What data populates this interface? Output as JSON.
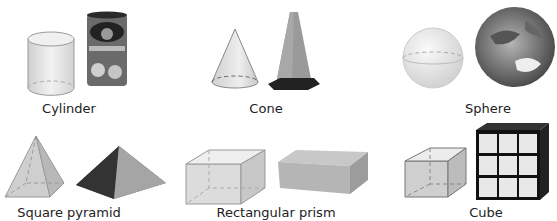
{
  "figure": {
    "items": [
      {
        "label": "Cylinder",
        "model": "cylinder-model",
        "example": "can"
      },
      {
        "label": "Cone",
        "model": "cone-model",
        "example": "traffic-cone"
      },
      {
        "label": "Sphere",
        "model": "sphere-model",
        "example": "earth-globe"
      },
      {
        "label": "Square pyramid",
        "model": "pyramid-model",
        "example": "stone-pyramid"
      },
      {
        "label": "Rectangular prism",
        "model": "prism-model",
        "example": "shoe-box"
      },
      {
        "label": "Cube",
        "model": "cube-model",
        "example": "rubiks-cube"
      }
    ],
    "colors": {
      "shape_fill": "#e4e4e4",
      "shape_stroke": "#8a8a8a",
      "dark": "#3a3a3a",
      "text": "#222222"
    }
  }
}
